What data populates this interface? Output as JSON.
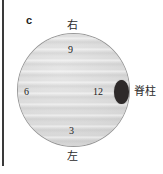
{
  "figure": {
    "panel_letter": "c",
    "diagram_type": "axial-body-cross-section-schematic",
    "colors": {
      "slice_fill": "#dcdcdc",
      "slice_outline": "#9a9a9a",
      "spine_marker": "#2e2a2a",
      "text": "#232323",
      "rule": "#3a3a3a",
      "background": "#ffffff"
    }
  },
  "orientation_labels": {
    "top": "右",
    "bottom": "左",
    "right": "脊柱"
  },
  "clock_numbers": [
    {
      "id": "9",
      "label": "9",
      "position": "top"
    },
    {
      "id": "6",
      "label": "6",
      "position": "left"
    },
    {
      "id": "12",
      "label": "12",
      "position": "right"
    },
    {
      "id": "3",
      "label": "3",
      "position": "bottom"
    }
  ]
}
